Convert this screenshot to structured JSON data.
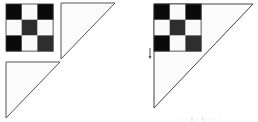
{
  "figure": {
    "colors": {
      "black": "#0a0a0a",
      "dark_gray": "#2e2e2e",
      "white": "#fafafa",
      "outline": "#555555",
      "triangle_fill": "#fbfbfb"
    },
    "left_group": {
      "checkerboard": {
        "x": 6,
        "y": 4,
        "cell": 15.7,
        "pattern": [
          [
            "black",
            "white",
            "black"
          ],
          [
            "white",
            "dark_gray",
            "white"
          ],
          [
            "black",
            "white",
            "dark_gray"
          ]
        ]
      },
      "triangle_top_right": {
        "points": [
          [
            61,
            3
          ],
          [
            115,
            3
          ],
          [
            61,
            59
          ]
        ]
      },
      "triangle_bottom_left": {
        "points": [
          [
            6,
            62
          ],
          [
            60,
            62
          ],
          [
            6,
            118
          ]
        ]
      }
    },
    "right_group": {
      "big_triangle": {
        "points": [
          [
            154,
            4
          ],
          [
            253,
            4
          ],
          [
            154,
            108
          ]
        ]
      },
      "checkerboard": {
        "x": 154,
        "y": 4,
        "cell": 15.7,
        "pattern": [
          [
            "black",
            "white",
            "black"
          ],
          [
            "white",
            "dark_gray",
            "white"
          ],
          [
            "black",
            "white",
            "dark_gray"
          ]
        ]
      },
      "arrow_marker": {
        "x": 150,
        "y1": 48,
        "y2": 58
      }
    },
    "caption": "· · l · l · · ·"
  }
}
